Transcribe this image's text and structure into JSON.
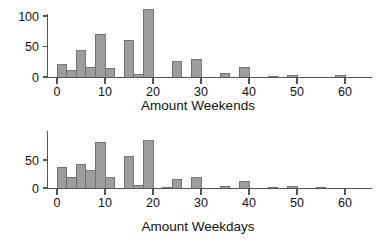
{
  "figure": {
    "background": "#ffffff",
    "bar_fill": "#9d9d9d",
    "bar_stroke": "#6e6e6e",
    "axis_color": "#555555"
  },
  "chart_data": [
    {
      "type": "bar",
      "name": "weekends-histogram",
      "title": "",
      "xlabel": "Amount Weekends",
      "ylabel": "",
      "xlim": [
        -1,
        62
      ],
      "ylim": [
        0,
        118
      ],
      "grid": false,
      "legend": "none",
      "bin_width": 2,
      "xticks": [
        0,
        10,
        20,
        30,
        40,
        50,
        60
      ],
      "xticklabels": [
        "0",
        "10",
        "20",
        "30",
        "40",
        "50",
        "60"
      ],
      "yticks": [
        0,
        50,
        100
      ],
      "yticklabels": [
        "0",
        "50",
        "100"
      ],
      "bins": [
        {
          "x0": 0,
          "x1": 2,
          "value": 20
        },
        {
          "x0": 2,
          "x1": 4,
          "value": 10
        },
        {
          "x0": 4,
          "x1": 6,
          "value": 43
        },
        {
          "x0": 6,
          "x1": 8,
          "value": 16
        },
        {
          "x0": 8,
          "x1": 10,
          "value": 70
        },
        {
          "x0": 10,
          "x1": 12,
          "value": 14
        },
        {
          "x0": 12,
          "x1": 14,
          "value": 0
        },
        {
          "x0": 14,
          "x1": 16,
          "value": 60
        },
        {
          "x0": 16,
          "x1": 18,
          "value": 4
        },
        {
          "x0": 18,
          "x1": 20,
          "value": 110
        },
        {
          "x0": 20,
          "x1": 22,
          "value": 0
        },
        {
          "x0": 22,
          "x1": 24,
          "value": 0
        },
        {
          "x0": 24,
          "x1": 26,
          "value": 25
        },
        {
          "x0": 26,
          "x1": 28,
          "value": 0
        },
        {
          "x0": 28,
          "x1": 30,
          "value": 29
        },
        {
          "x0": 30,
          "x1": 32,
          "value": 0
        },
        {
          "x0": 32,
          "x1": 34,
          "value": 0
        },
        {
          "x0": 34,
          "x1": 36,
          "value": 6
        },
        {
          "x0": 36,
          "x1": 38,
          "value": 0
        },
        {
          "x0": 38,
          "x1": 40,
          "value": 16
        },
        {
          "x0": 40,
          "x1": 42,
          "value": 0
        },
        {
          "x0": 42,
          "x1": 44,
          "value": 0
        },
        {
          "x0": 44,
          "x1": 46,
          "value": 1
        },
        {
          "x0": 46,
          "x1": 48,
          "value": 0
        },
        {
          "x0": 48,
          "x1": 50,
          "value": 2
        },
        {
          "x0": 50,
          "x1": 52,
          "value": 0
        },
        {
          "x0": 52,
          "x1": 54,
          "value": 0
        },
        {
          "x0": 54,
          "x1": 56,
          "value": 0
        },
        {
          "x0": 56,
          "x1": 58,
          "value": 0
        },
        {
          "x0": 58,
          "x1": 60,
          "value": 2
        }
      ]
    },
    {
      "type": "bar",
      "name": "weekdays-histogram",
      "title": "",
      "xlabel": "Amount Weekdays",
      "ylabel": "",
      "xlim": [
        -1,
        62
      ],
      "ylim": [
        0,
        92
      ],
      "grid": false,
      "legend": "none",
      "bin_width": 2,
      "xticks": [
        0,
        10,
        20,
        30,
        40,
        50,
        60
      ],
      "xticklabels": [
        "0",
        "10",
        "20",
        "30",
        "40",
        "50",
        "60"
      ],
      "yticks": [
        0,
        50
      ],
      "yticklabels": [
        "0",
        "50"
      ],
      "bins": [
        {
          "x0": 0,
          "x1": 2,
          "value": 37
        },
        {
          "x0": 2,
          "x1": 4,
          "value": 19
        },
        {
          "x0": 4,
          "x1": 6,
          "value": 42
        },
        {
          "x0": 6,
          "x1": 8,
          "value": 31
        },
        {
          "x0": 8,
          "x1": 10,
          "value": 82
        },
        {
          "x0": 10,
          "x1": 12,
          "value": 18
        },
        {
          "x0": 12,
          "x1": 14,
          "value": 0
        },
        {
          "x0": 14,
          "x1": 16,
          "value": 56
        },
        {
          "x0": 16,
          "x1": 18,
          "value": 5
        },
        {
          "x0": 18,
          "x1": 20,
          "value": 84
        },
        {
          "x0": 20,
          "x1": 22,
          "value": 0
        },
        {
          "x0": 22,
          "x1": 24,
          "value": 1
        },
        {
          "x0": 24,
          "x1": 26,
          "value": 16
        },
        {
          "x0": 26,
          "x1": 28,
          "value": 0
        },
        {
          "x0": 28,
          "x1": 30,
          "value": 18
        },
        {
          "x0": 30,
          "x1": 32,
          "value": 0
        },
        {
          "x0": 32,
          "x1": 34,
          "value": 0
        },
        {
          "x0": 34,
          "x1": 36,
          "value": 3
        },
        {
          "x0": 36,
          "x1": 38,
          "value": 0
        },
        {
          "x0": 38,
          "x1": 40,
          "value": 11
        },
        {
          "x0": 40,
          "x1": 42,
          "value": 0
        },
        {
          "x0": 42,
          "x1": 44,
          "value": 0
        },
        {
          "x0": 44,
          "x1": 46,
          "value": 1
        },
        {
          "x0": 46,
          "x1": 48,
          "value": 0
        },
        {
          "x0": 48,
          "x1": 50,
          "value": 2
        },
        {
          "x0": 50,
          "x1": 52,
          "value": 0
        },
        {
          "x0": 52,
          "x1": 54,
          "value": 0
        },
        {
          "x0": 54,
          "x1": 56,
          "value": 1
        }
      ]
    }
  ]
}
